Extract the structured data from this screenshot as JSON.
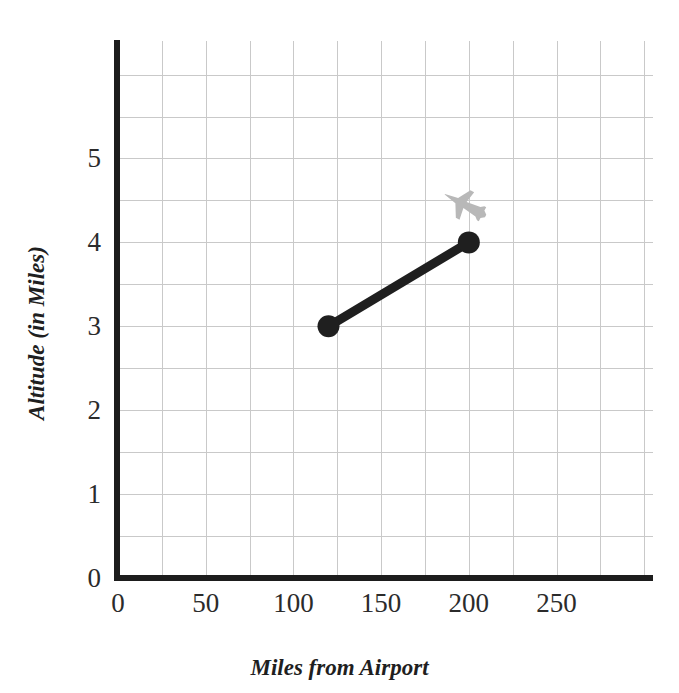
{
  "chart_data": {
    "type": "line",
    "title": "",
    "xlabel": "Miles from Airport",
    "ylabel": "Altitude (in Miles)",
    "xlim": [
      0,
      305
    ],
    "ylim": [
      0,
      6.4
    ],
    "xticks": [
      0,
      50,
      100,
      150,
      200,
      250
    ],
    "xtick_labels": [
      "0",
      "50",
      "100",
      "150",
      "200",
      "250"
    ],
    "yticks": [
      0,
      1,
      2,
      3,
      4,
      5
    ],
    "ytick_labels": [
      "0",
      "1",
      "2",
      "3",
      "4",
      "5"
    ],
    "grid": true,
    "grid_x_step": 25,
    "grid_y_step": 0.5,
    "legend": "none",
    "series": [
      {
        "name": "Descent path",
        "marker": "filled-circle",
        "color": "#1f1f1f",
        "x": [
          120,
          200
        ],
        "y": [
          3,
          4
        ],
        "points": [
          {
            "x": 120,
            "y": 3
          },
          {
            "x": 200,
            "y": 4
          }
        ]
      }
    ],
    "annotations": [
      {
        "kind": "airplane-icon",
        "x": 198,
        "y": 4.45,
        "color": "#b8b8b8"
      }
    ]
  },
  "axes": {
    "x_title": "Miles from Airport",
    "y_title": "Altitude (in Miles)",
    "axis_color": "#1d1d1d",
    "grid_color": "#c9c9c9"
  },
  "icons": {
    "airplane": "airplane-icon"
  },
  "top_strip": {
    "clipped_text": ""
  }
}
